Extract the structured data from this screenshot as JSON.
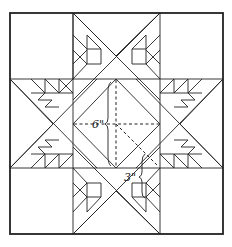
{
  "diagram": {
    "labels": {
      "center_dimension": "6\"",
      "point_dimension": "3\""
    },
    "colors": {
      "line": "#222222",
      "background": "#ffffff"
    }
  }
}
